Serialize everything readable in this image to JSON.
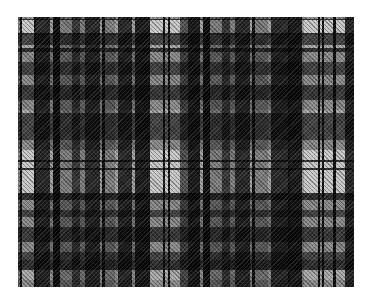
{
  "image": {
    "description": "Grayscale tartan plaid fabric pattern",
    "area": {
      "x": 18,
      "y": 17,
      "width": 336,
      "height": 270
    },
    "colors": {
      "background": "#ffffff",
      "light": "#e0e0e0",
      "mid_light": "#b4b4b4",
      "mid": "#8c8c8c",
      "mid_dark": "#5a5a5a",
      "dark": "#2a2a2a",
      "darkest": "#0c0c0c"
    },
    "warp_stripes": [
      {
        "from": 0,
        "to": 2,
        "color": "#8c8c8c"
      },
      {
        "from": 2,
        "to": 4,
        "color": "#0c0c0c"
      },
      {
        "from": 4,
        "to": 16,
        "color": "#e0e0e0"
      },
      {
        "from": 16,
        "to": 18,
        "color": "#0c0c0c"
      },
      {
        "from": 18,
        "to": 32,
        "color": "#2a2a2a"
      },
      {
        "from": 32,
        "to": 35,
        "color": "#b4b4b4"
      },
      {
        "from": 35,
        "to": 42,
        "color": "#0c0c0c"
      },
      {
        "from": 42,
        "to": 54,
        "color": "#8c8c8c"
      },
      {
        "from": 54,
        "to": 62,
        "color": "#3a3a3a"
      },
      {
        "from": 62,
        "to": 67,
        "color": "#8c8c8c"
      },
      {
        "from": 67,
        "to": 82,
        "color": "#2a2a2a"
      },
      {
        "from": 82,
        "to": 84,
        "color": "#b4b4b4"
      },
      {
        "from": 84,
        "to": 87,
        "color": "#0c0c0c"
      },
      {
        "from": 87,
        "to": 97,
        "color": "#8c8c8c"
      },
      {
        "from": 97,
        "to": 100,
        "color": "#b4b4b4"
      },
      {
        "from": 100,
        "to": 114,
        "color": "#2a2a2a"
      },
      {
        "from": 114,
        "to": 117,
        "color": "#b4b4b4"
      },
      {
        "from": 117,
        "to": 132,
        "color": "#1a1a1a"
      },
      {
        "from": 132,
        "to": 145,
        "color": "#e0e0e0"
      },
      {
        "from": 145,
        "to": 147,
        "color": "#0c0c0c"
      },
      {
        "from": 147,
        "to": 150,
        "color": "#e0e0e0"
      },
      {
        "from": 150,
        "to": 152,
        "color": "#0c0c0c"
      },
      {
        "from": 152,
        "to": 162,
        "color": "#e0e0e0"
      },
      {
        "from": 162,
        "to": 170,
        "color": "#5a5a5a"
      },
      {
        "from": 170,
        "to": 182,
        "color": "#1a1a1a"
      },
      {
        "from": 182,
        "to": 185,
        "color": "#b4b4b4"
      },
      {
        "from": 185,
        "to": 192,
        "color": "#0c0c0c"
      },
      {
        "from": 192,
        "to": 204,
        "color": "#8c8c8c"
      },
      {
        "from": 204,
        "to": 212,
        "color": "#3a3a3a"
      },
      {
        "from": 212,
        "to": 217,
        "color": "#8c8c8c"
      },
      {
        "from": 217,
        "to": 232,
        "color": "#2a2a2a"
      },
      {
        "from": 232,
        "to": 234,
        "color": "#b4b4b4"
      },
      {
        "from": 234,
        "to": 237,
        "color": "#0c0c0c"
      },
      {
        "from": 237,
        "to": 250,
        "color": "#8c8c8c"
      },
      {
        "from": 250,
        "to": 253,
        "color": "#b4b4b4"
      },
      {
        "from": 253,
        "to": 270,
        "color": "#2a2a2a"
      },
      {
        "from": 270,
        "to": 272,
        "color": "#0c0c0c"
      },
      {
        "from": 272,
        "to": 284,
        "color": "#1a1a1a"
      },
      {
        "from": 284,
        "to": 286,
        "color": "#b4b4b4"
      },
      {
        "from": 286,
        "to": 300,
        "color": "#e0e0e0"
      },
      {
        "from": 300,
        "to": 302,
        "color": "#0c0c0c"
      },
      {
        "from": 302,
        "to": 304,
        "color": "#e0e0e0"
      },
      {
        "from": 304,
        "to": 306,
        "color": "#0c0c0c"
      },
      {
        "from": 306,
        "to": 315,
        "color": "#e0e0e0"
      },
      {
        "from": 315,
        "to": 318,
        "color": "#0c0c0c"
      },
      {
        "from": 318,
        "to": 327,
        "color": "#e0e0e0"
      },
      {
        "from": 327,
        "to": 336,
        "color": "#2a2a2a"
      }
    ],
    "weft_stripes": [
      {
        "from": 0,
        "to": 2,
        "color": "#8c8c8c"
      },
      {
        "from": 2,
        "to": 3,
        "color": "#0c0c0c"
      },
      {
        "from": 3,
        "to": 16,
        "color": "#e0e0e0"
      },
      {
        "from": 16,
        "to": 18,
        "color": "#0c0c0c"
      },
      {
        "from": 18,
        "to": 28,
        "color": "#2a2a2a"
      },
      {
        "from": 28,
        "to": 31,
        "color": "#b4b4b4"
      },
      {
        "from": 31,
        "to": 35,
        "color": "#0c0c0c"
      },
      {
        "from": 35,
        "to": 45,
        "color": "#8c8c8c"
      },
      {
        "from": 45,
        "to": 58,
        "color": "#2a2a2a"
      },
      {
        "from": 58,
        "to": 68,
        "color": "#8c8c8c"
      },
      {
        "from": 68,
        "to": 83,
        "color": "#1a1a1a"
      },
      {
        "from": 83,
        "to": 93,
        "color": "#8c8c8c"
      },
      {
        "from": 93,
        "to": 96,
        "color": "#b4b4b4"
      },
      {
        "from": 96,
        "to": 123,
        "color": "#2a2a2a"
      },
      {
        "from": 123,
        "to": 133,
        "color": "#8c8c8c"
      },
      {
        "from": 133,
        "to": 143,
        "color": "#e0e0e0"
      },
      {
        "from": 143,
        "to": 145,
        "color": "#0c0c0c"
      },
      {
        "from": 145,
        "to": 151,
        "color": "#e0e0e0"
      },
      {
        "from": 151,
        "to": 153,
        "color": "#0c0c0c"
      },
      {
        "from": 153,
        "to": 176,
        "color": "#e0e0e0"
      },
      {
        "from": 176,
        "to": 183,
        "color": "#0c0c0c"
      },
      {
        "from": 183,
        "to": 193,
        "color": "#8c8c8c"
      },
      {
        "from": 193,
        "to": 200,
        "color": "#2a2a2a"
      },
      {
        "from": 200,
        "to": 210,
        "color": "#8c8c8c"
      },
      {
        "from": 210,
        "to": 225,
        "color": "#1a1a1a"
      },
      {
        "from": 225,
        "to": 235,
        "color": "#8c8c8c"
      },
      {
        "from": 235,
        "to": 243,
        "color": "#2a2a2a"
      },
      {
        "from": 243,
        "to": 253,
        "color": "#0c0c0c"
      },
      {
        "from": 253,
        "to": 263,
        "color": "#b4b4b4"
      },
      {
        "from": 263,
        "to": 270,
        "color": "#8c8c8c"
      }
    ]
  }
}
